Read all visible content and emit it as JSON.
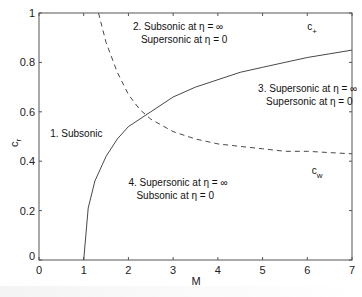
{
  "chart_data": {
    "type": "line",
    "title": "",
    "xlabel": "M",
    "ylabel": "c_r",
    "xlim": [
      0,
      7
    ],
    "ylim": [
      0,
      1
    ],
    "grid": false,
    "xticks": [
      "0",
      "1",
      "2",
      "3",
      "4",
      "5",
      "6",
      "7"
    ],
    "yticks": [
      "0",
      "0.2",
      "0.4",
      "0.6",
      "0.8",
      "1"
    ],
    "series": [
      {
        "name": "c+",
        "label_main": "c",
        "label_sub": "+",
        "style": "solid",
        "x": [
          1.0,
          1.1,
          1.25,
          1.5,
          1.75,
          2.0,
          2.5,
          3.0,
          3.5,
          4.0,
          4.5,
          5.0,
          5.5,
          6.0,
          6.5,
          7.0
        ],
        "y": [
          0.0,
          0.21,
          0.32,
          0.42,
          0.49,
          0.54,
          0.6,
          0.66,
          0.7,
          0.73,
          0.76,
          0.78,
          0.8,
          0.82,
          0.835,
          0.85
        ]
      },
      {
        "name": "cw",
        "label_main": "c",
        "label_sub": "w",
        "style": "dashed",
        "x": [
          1.33,
          1.5,
          1.75,
          2.0,
          2.25,
          2.5,
          3.0,
          3.5,
          4.0,
          4.5,
          5.0,
          5.5,
          6.0,
          6.5,
          7.0
        ],
        "y": [
          1.0,
          0.88,
          0.76,
          0.67,
          0.61,
          0.57,
          0.52,
          0.49,
          0.47,
          0.46,
          0.45,
          0.44,
          0.44,
          0.435,
          0.43
        ]
      }
    ],
    "annotations": [
      {
        "lines": [
          "1. Subsonic"
        ],
        "x": 0.25,
        "y": 0.5
      },
      {
        "lines": [
          "2. Subsonic at η = ∞",
          "Supersonic at η = 0"
        ],
        "x": 2.1,
        "y": 0.93
      },
      {
        "lines": [
          "3. Supersonic at η = ∞",
          "Supersonic at η = 0"
        ],
        "x": 4.9,
        "y": 0.68
      },
      {
        "lines": [
          "4. Supersonic at η = ∞",
          "Subsonic at η = 0"
        ],
        "x": 2.0,
        "y": 0.3
      }
    ],
    "series_labels": [
      {
        "series": "c+",
        "x": 6.0,
        "y": 0.93
      },
      {
        "series": "cw",
        "x": 6.1,
        "y": 0.35
      }
    ],
    "colors": {
      "axis": "#555555",
      "line": "#333333",
      "text": "#111111"
    }
  }
}
